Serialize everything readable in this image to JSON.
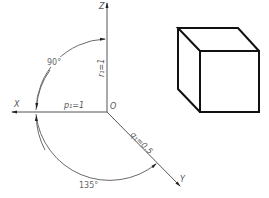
{
  "diagram": {
    "type": "axonometric-axes-with-cube",
    "axes": {
      "origin_label": "O",
      "x_label": "X",
      "y_label": "Y",
      "z_label": "Z"
    },
    "coefficients": {
      "p1": "p₁=1",
      "q1": "q₁=0.5",
      "r1": "r₁=1"
    },
    "angles": {
      "xz": "90°",
      "xy": "135°"
    },
    "colors": {
      "axis": "#555555",
      "cube": "#111111",
      "background": "#ffffff"
    }
  }
}
